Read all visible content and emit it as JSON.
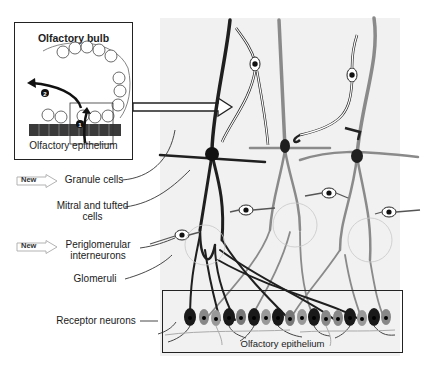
{
  "inset": {
    "title": "Olfactory bulb",
    "caption": "Olfactory epithelium",
    "markers": [
      {
        "id": "1",
        "label": "1"
      },
      {
        "id": "2",
        "label": "2"
      }
    ]
  },
  "labels": {
    "granule_cells": "Granule cells",
    "mitral_tufted_line1": "Mitral and tufted",
    "mitral_tufted_line2": "cells",
    "periglomerular_line1": "Periglomerular",
    "periglomerular_line2": "interneurons",
    "glomeruli": "Glomeruli",
    "receptor_neurons": "Receptor neurons",
    "epithelium_box": "Olfactory epithelium"
  },
  "badges": [
    {
      "target": "granule_cells",
      "text": "New"
    },
    {
      "target": "periglomerular_interneurons",
      "text": "New"
    }
  ],
  "colors": {
    "dark_neuron": "#1f1f1f",
    "gray_neuron": "#8a8a8a",
    "panel_bg": "#f1f1f1",
    "outline": "#222222"
  }
}
